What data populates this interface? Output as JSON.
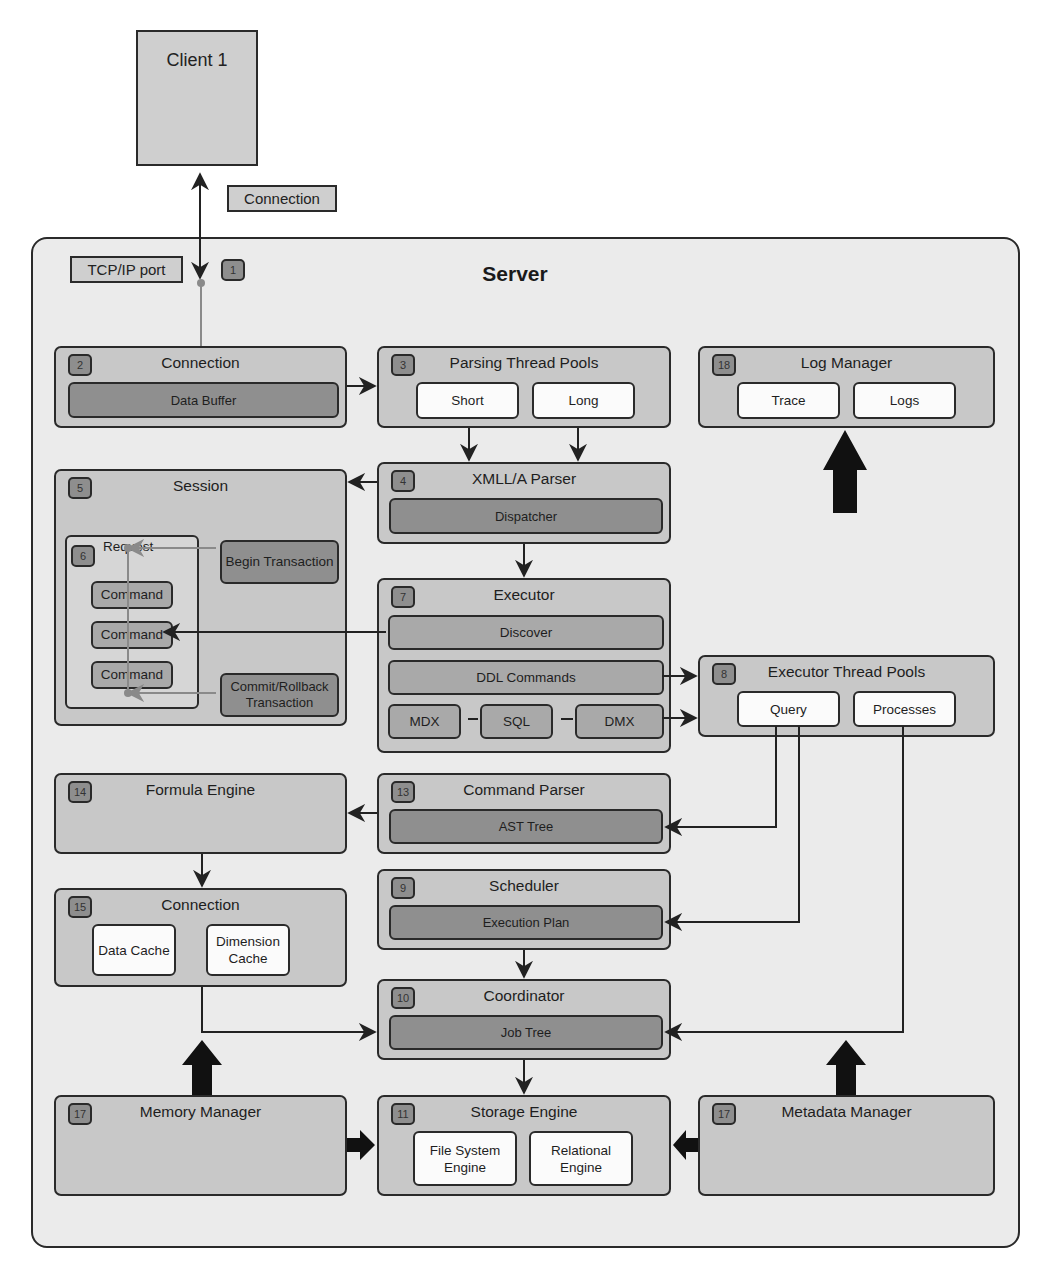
{
  "client": {
    "label": "Client 1"
  },
  "connection_label": "Connection",
  "server": {
    "title": "Server",
    "tcp_port_label": "TCP/IP port",
    "tcp_port_badge": "1"
  },
  "components": {
    "connection": {
      "badge": "2",
      "title": "Connection",
      "inner": "Data Buffer"
    },
    "parsing_thread_pools": {
      "badge": "3",
      "title": "Parsing Thread Pools",
      "items": [
        "Short",
        "Long"
      ]
    },
    "log_manager": {
      "badge": "18",
      "title": "Log Manager",
      "items": [
        "Trace",
        "Logs"
      ]
    },
    "xmla_parser": {
      "badge": "4",
      "title": "XMLL/A Parser",
      "inner": "Dispatcher"
    },
    "session": {
      "badge": "5",
      "title": "Session",
      "request": {
        "badge": "6",
        "title": "Request",
        "commands": [
          "Command",
          "Command",
          "Command"
        ]
      },
      "begin_transaction": "Begin Transaction",
      "commit_rollback": "Commit/Rollback Transaction"
    },
    "executor": {
      "badge": "7",
      "title": "Executor",
      "discover": "Discover",
      "ddl": "DDL Commands",
      "languages": [
        "MDX",
        "SQL",
        "DMX"
      ]
    },
    "executor_thread_pools": {
      "badge": "8",
      "title": "Executor Thread Pools",
      "items": [
        "Query",
        "Processes"
      ]
    },
    "formula_engine": {
      "badge": "14",
      "title": "Formula Engine"
    },
    "command_parser": {
      "badge": "13",
      "title": "Command Parser",
      "inner": "AST Tree"
    },
    "cache_connection": {
      "badge": "15",
      "title": "Connection",
      "items": [
        "Data Cache",
        "Dimension Cache"
      ]
    },
    "scheduler": {
      "badge": "9",
      "title": "Scheduler",
      "inner": "Execution Plan"
    },
    "coordinator": {
      "badge": "10",
      "title": "Coordinator",
      "inner": "Job Tree"
    },
    "memory_manager": {
      "badge": "17",
      "title": "Memory Manager"
    },
    "storage_engine": {
      "badge": "11",
      "title": "Storage Engine",
      "items": [
        "File System Engine",
        "Relational Engine"
      ]
    },
    "metadata_manager": {
      "badge": "17",
      "title": "Metadata Manager"
    }
  },
  "colors": {
    "background": "#ffffff",
    "server_fill": "#ebebeb",
    "component_fill": "#c8c8c8",
    "inner_dark": "#8f8f8f",
    "inner_white": "#fbfbfb",
    "badge_fill": "#8e8e8e",
    "stroke": "#2a2a2a",
    "grey_link": "#8a8a8a"
  }
}
